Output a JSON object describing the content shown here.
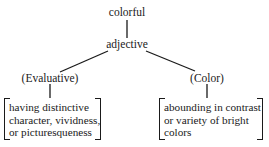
{
  "diagram": {
    "root": {
      "label": "colorful"
    },
    "pos": {
      "label": "adjective"
    },
    "senses": [
      {
        "label": "(Evaluative)",
        "definition_lines": [
          "having distinctive",
          "character, vividness,",
          "or picturesqueness"
        ]
      },
      {
        "label": "(Color)",
        "definition_lines": [
          "abounding in contrast",
          "or variety of bright",
          "colors"
        ]
      }
    ],
    "colors": {
      "ink": "#1a1a1a",
      "background": "#ffffff"
    }
  }
}
